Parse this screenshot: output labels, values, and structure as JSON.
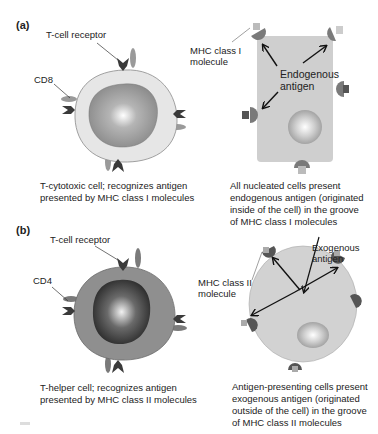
{
  "panels": [
    {
      "tag": "(a)",
      "left": {
        "labels": {
          "receptor": "T-cell receptor",
          "coreceptor": "CD8"
        },
        "caption": [
          "T-cytotoxic cell; recognizes antigen",
          "presented by MHC class I molecules"
        ]
      },
      "right": {
        "labels": {
          "mhc": [
            "MHC class I",
            "molecule"
          ],
          "antigen": [
            "Endogenous",
            "antigen"
          ]
        },
        "caption": [
          "All nucleated cells present",
          "endogenous antigen (originated",
          "inside of the cell) in the groove",
          "of MHC class I molecules"
        ]
      }
    },
    {
      "tag": "(b)",
      "left": {
        "labels": {
          "receptor": "T-cell receptor",
          "coreceptor": "CD4"
        },
        "caption": [
          "T-helper cell; recognizes antigen",
          "presented by MHC class II molecules"
        ]
      },
      "right": {
        "labels": {
          "mhc": [
            "MHC class II",
            "molecule"
          ],
          "antigen": [
            "Exogenous",
            "antigen"
          ]
        },
        "caption": [
          "Antigen-presenting cells present",
          "exogenous antigen (originated",
          "outside of the cell) in the groove",
          "of MHC class II molecules"
        ]
      }
    }
  ],
  "colors": {
    "tc_cytoplasm": "#e6e6e6",
    "th_cytoplasm": "#8f8f8f",
    "nucleated_cell": "#cfcfcf",
    "apc_cell": "#d2d2d2",
    "receptor": "#3a3a3a",
    "coreceptor": "#9a9a9a",
    "mhc": "#7a7a7a"
  }
}
